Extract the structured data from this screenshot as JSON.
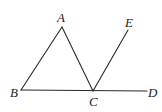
{
  "diagram": {
    "type": "geometry",
    "points": {
      "A": {
        "label": "A",
        "x": 62,
        "y": 27,
        "label_x": 57,
        "label_y": 22
      },
      "B": {
        "label": "B",
        "x": 21,
        "y": 90,
        "label_x": 10,
        "label_y": 97
      },
      "C": {
        "label": "C",
        "x": 93,
        "y": 91,
        "label_x": 89,
        "label_y": 106
      },
      "D": {
        "label": "D",
        "x": 147,
        "y": 91,
        "label_x": 148,
        "label_y": 97
      },
      "E": {
        "label": "E",
        "x": 128,
        "y": 30,
        "label_x": 125,
        "label_y": 27
      }
    },
    "segments": [
      {
        "name": "AB",
        "from": "A",
        "to": "B"
      },
      {
        "name": "AC",
        "from": "A",
        "to": "C"
      },
      {
        "name": "BD",
        "from": "B",
        "to": "D"
      },
      {
        "name": "CE",
        "from": "C",
        "to": "E"
      }
    ],
    "line_color": "#2a2a2a",
    "label_color": "#222222"
  }
}
